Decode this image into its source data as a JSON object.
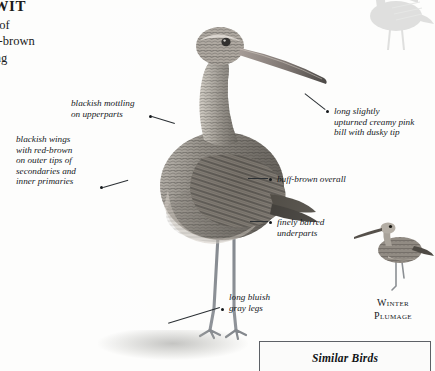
{
  "page": {
    "background": "#fdfdfc",
    "ink": "#15191c"
  },
  "article": {
    "title": "DWIT",
    "paragraph_left_clipped": "s call of\ns buff-brown\nits long\n Very",
    "paragraph_left_clipped_2": "se"
  },
  "callouts": [
    {
      "id": "upperparts",
      "text": "blackish mottling\non upperparts",
      "dot": {
        "x": 150,
        "y": 116
      }
    },
    {
      "id": "wings",
      "text": "blackish wings\nwith red-brown\non outer tips of\nsecondaries and\ninner primaries",
      "dot": {
        "x": 101,
        "y": 187
      }
    },
    {
      "id": "bill",
      "text": "long slightly\nupturned creamy pink\nbill with dusky tip",
      "dot": {
        "x": 327,
        "y": 111
      }
    },
    {
      "id": "overall",
      "text": "buff-brown overall",
      "dot": {
        "x": 270,
        "y": 179
      }
    },
    {
      "id": "underparts",
      "text": "finely barred\nunderparts",
      "dot": {
        "x": 270,
        "y": 222
      }
    },
    {
      "id": "legs",
      "text": "long bluish\ngray legs",
      "dot": {
        "x": 222,
        "y": 309
      }
    }
  ],
  "winter_plumage": {
    "line1": "Winter",
    "line2": "Plumage"
  },
  "similar_birds": {
    "heading": "Similar Birds"
  },
  "illustrations": {
    "main_bird": "marbled-godwit-breeding-plumage",
    "winter_bird": "godwit-winter-plumage-small",
    "corner_bird": "godwit-silhouette-ghost"
  }
}
